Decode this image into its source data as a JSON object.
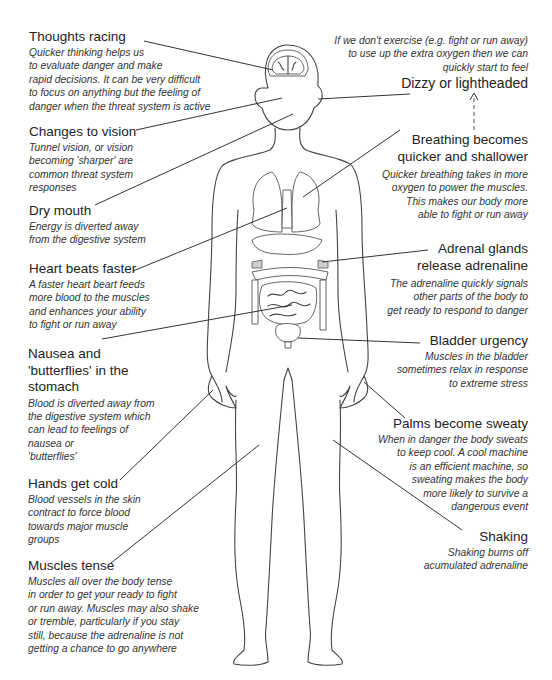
{
  "diagram": {
    "annotations": [
      {
        "id": "thoughts-racing",
        "title": "Thoughts racing",
        "description": "Quicker thinking helps us\nto evaluate danger and make\nrapid decisions. It can be very difficult\nto focus on anything but the feeling of\ndanger when the threat system is active"
      },
      {
        "id": "changes-to-vision",
        "title": "Changes to vision",
        "description": "Tunnel vision, or vision\nbecoming 'sharper' are\ncommon threat system\nresponses"
      },
      {
        "id": "dry-mouth",
        "title": "Dry mouth",
        "description": "Energy is diverted away\nfrom the digestive system"
      },
      {
        "id": "heart-beats-faster",
        "title": "Heart beats faster",
        "description": "A faster heart beart feeds\nmore blood to the muscles\nand enhances your ability\nto fight or run away"
      },
      {
        "id": "nausea",
        "title": "Nausea and\n'butterflies' in the\nstomach",
        "description": "Blood is diverted away from\nthe digestive system which\ncan lead to feelings of\nnausea or\n'butterflies'"
      },
      {
        "id": "hands-get-cold",
        "title": "Hands get cold",
        "description": "Blood vessels in the skin\ncontract to force blood\ntowards major muscle\ngroups"
      },
      {
        "id": "muscles-tense",
        "title": "Muscles tense",
        "description": "Muscles all over the body tense\nin order to get your ready to fight\nor run away. Muscles may also shake\nor tremble, particularly if you stay\nstill, because the adrenaline is not\ngetting a chance to go anywhere"
      },
      {
        "id": "dizzy",
        "title": "Dizzy or lightheaded",
        "preface": "If we don't exercise (e.g. fight or run away)\nto use up the extra oxygen then we can\nquickly start to feel"
      },
      {
        "id": "breathing",
        "title": "Breathing becomes\nquicker and shallower",
        "description": "Quicker breathing takes in more\noxygen to power the muscles.\nThis makes our body more\nable to fight or run away"
      },
      {
        "id": "adrenal",
        "title": "Adrenal glands\nrelease adrenaline",
        "description": "The adrenaline quickly signals\nother parts of the body to\nget ready to respond to danger"
      },
      {
        "id": "bladder",
        "title": "Bladder urgency",
        "description": "Muscles in the bladder\nsometimes relax in response\nto extreme stress"
      },
      {
        "id": "palms",
        "title": "Palms become sweaty",
        "description": "When in danger the body sweats\nto keep cool.  A cool machine\nis an efficient machine, so\nsweating makes the body\nmore likely to survive a\ndangerous event"
      },
      {
        "id": "shaking",
        "title": "Shaking",
        "description": "Shaking burns off\nacumulated adrenaline"
      }
    ],
    "colors": {
      "line": "#333333",
      "gland_fill": "#cfcfcf",
      "text": "#2a2a2a"
    }
  }
}
